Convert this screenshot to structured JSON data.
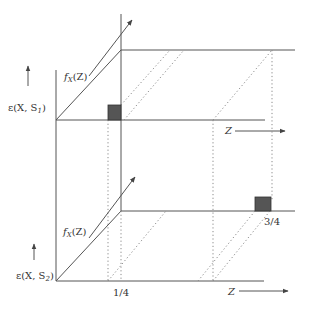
{
  "diagram": {
    "colors": {
      "line": "#555555",
      "dotted": "#8a8a8a",
      "marker_fill": "#555555",
      "marker_stroke": "#333333",
      "text": "#333333"
    },
    "upper_panel": {
      "y_axis_label": "ε(X, S₁)",
      "diagonal_label": "f_X(Z)",
      "x_axis_label": "Z",
      "marker": "square at Z = 1/4"
    },
    "lower_panel": {
      "y_axis_label": "ε(X, S₂)",
      "diagonal_label": "f_X(Z)",
      "x_axis_label": "Z",
      "marker": "square at Z = 3/4"
    },
    "tick_labels": {
      "quarter": "1/4",
      "three_quarter": "3/4"
    },
    "text": {
      "eps": "ε(X, S",
      "sub1": "1",
      "sub2": "2",
      "close_paren": ")",
      "f": "f",
      "fsub": "X",
      "fz": "(Z)",
      "z": "Z"
    }
  }
}
